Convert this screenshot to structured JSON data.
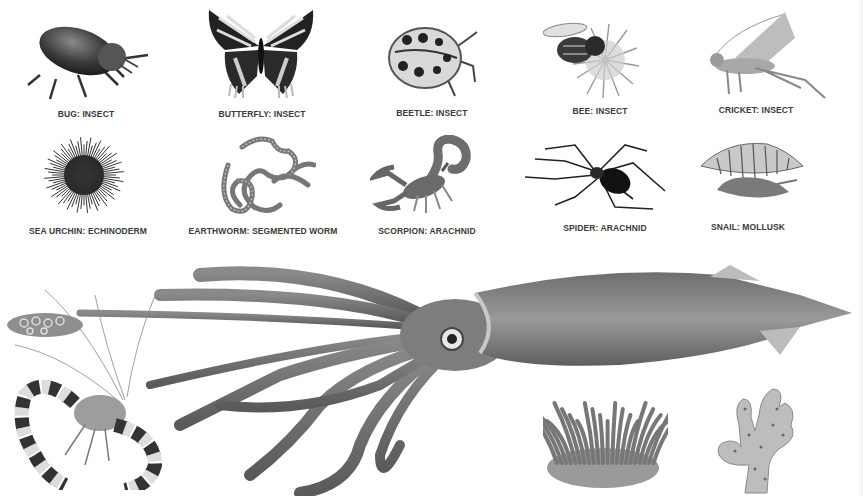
{
  "plate": {
    "subject": "Invertebrates illustration plate",
    "rows": [
      {
        "items": [
          {
            "id": "bug",
            "icon": "bug-icon",
            "caption": "BUG: INSECT"
          },
          {
            "id": "butterfly",
            "icon": "butterfly-icon",
            "caption": "BUTTERFLY: INSECT"
          },
          {
            "id": "beetle",
            "icon": "ladybird-beetle-icon",
            "caption": "BEETLE: INSECT"
          },
          {
            "id": "bee",
            "icon": "bee-on-flower-icon",
            "caption": "BEE: INSECT"
          },
          {
            "id": "cricket",
            "icon": "cricket-icon",
            "caption": "CRICKET: INSECT"
          }
        ]
      },
      {
        "items": [
          {
            "id": "sea-urchin",
            "icon": "sea-urchin-icon",
            "caption": "SEA URCHIN: ECHINODERM"
          },
          {
            "id": "earthworm",
            "icon": "earthworm-icon",
            "caption": "EARTHWORM: SEGMENTED WORM"
          },
          {
            "id": "scorpion",
            "icon": "scorpion-icon",
            "caption": "SCORPION: ARACHNID"
          },
          {
            "id": "spider",
            "icon": "spider-icon",
            "caption": "SPIDER: ARACHNID"
          },
          {
            "id": "snail",
            "icon": "snail-icon",
            "caption": "SNAIL: MOLLUSK"
          }
        ]
      }
    ],
    "uncaptioned_illustrations": [
      {
        "id": "squid",
        "icon": "squid-icon"
      },
      {
        "id": "shrimp",
        "icon": "shrimp-icon"
      },
      {
        "id": "sea-anemone",
        "icon": "sea-anemone-icon"
      },
      {
        "id": "sponge",
        "icon": "sponge-icon"
      }
    ]
  }
}
